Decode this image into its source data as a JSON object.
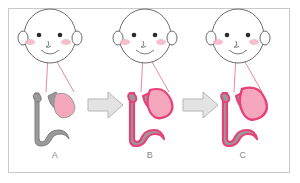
{
  "figure": {
    "type": "medical-illustration",
    "title": "",
    "border_color": "#c9c9c9",
    "background": "#ffffff"
  },
  "panels": [
    {
      "id": "A",
      "label": "A",
      "face": {
        "icon": "infant-face-icon",
        "outline_color": "#6b6b6b",
        "blush_color": "#f5b4c4",
        "eye_color": "#2b2b2b"
      },
      "pointer_lines": {
        "color": "#e8889f",
        "count": 2
      },
      "anatomy": {
        "tube_color": "#9a9a9a",
        "tube_outline": "#7d7d7d",
        "mass_color": "#f5a8bd",
        "mass_outline": "#9a9a9a",
        "mucosa_color": "none",
        "stage_description": "normal"
      }
    },
    {
      "id": "B",
      "label": "B",
      "face": {
        "icon": "infant-face-icon",
        "outline_color": "#6b6b6b",
        "blush_color": "#f5b4c4",
        "eye_color": "#2b2b2b"
      },
      "pointer_lines": {
        "color": "#e8889f",
        "count": 2
      },
      "anatomy": {
        "tube_color": "#9a9a9a",
        "tube_outline": "#e8417a",
        "mass_color": "#f5a8bd",
        "mass_outline": "#e8417a",
        "mucosa_color": "#e8417a",
        "stage_description": "inflamed"
      }
    },
    {
      "id": "C",
      "label": "C",
      "face": {
        "icon": "infant-face-icon",
        "outline_color": "#6b6b6b",
        "blush_color": "#f5b4c4",
        "eye_color": "#2b2b2b"
      },
      "pointer_lines": {
        "color": "#e8889f",
        "count": 2
      },
      "anatomy": {
        "tube_color": "#9a9a9a",
        "tube_outline": "#e8417a",
        "mass_color": "#f5a8bd",
        "mass_outline": "#e8417a",
        "mucosa_color": "#e8417a",
        "stage_description": "enlarged"
      }
    }
  ],
  "arrows": [
    {
      "id": "arrow-1",
      "direction": "right",
      "fill": "#e3e3e3",
      "stroke": "#b5b5b5"
    },
    {
      "id": "arrow-2",
      "direction": "right",
      "fill": "#e3e3e3",
      "stroke": "#b5b5b5"
    }
  ]
}
